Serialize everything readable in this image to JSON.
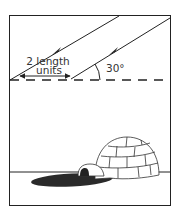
{
  "diagram": {
    "distance_label_line1": "2 length",
    "distance_label_line2": "units",
    "angle_label": "30°",
    "colors": {
      "line": "#222222",
      "shadow": "#2a2a2a",
      "background": "#ffffff"
    }
  }
}
